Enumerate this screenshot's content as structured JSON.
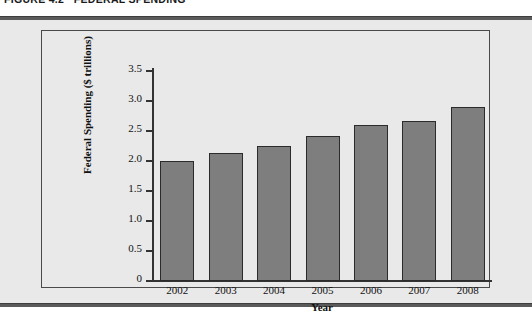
{
  "figure": {
    "caption": "FIGURE 4.2   FEDERAL SPENDING"
  },
  "chart_data": {
    "type": "bar",
    "title": "",
    "categories": [
      "2002",
      "2003",
      "2004",
      "2005",
      "2006",
      "2007",
      "2008"
    ],
    "values": [
      2.0,
      2.13,
      2.25,
      2.42,
      2.6,
      2.67,
      2.9
    ],
    "xlabel": "Year",
    "ylabel": "Federal Spending ($ trillions)",
    "ylim": [
      0,
      3.5
    ],
    "ytick_labels": [
      "0",
      "0.5",
      "1.0",
      "1.5",
      "2.0",
      "2.5",
      "3.0",
      "3.5"
    ],
    "ytick_values": [
      0,
      0.5,
      1.0,
      1.5,
      2.0,
      2.5,
      3.0,
      3.5
    ],
    "grid": false,
    "legend": null,
    "bar_color": "#7e7e7e",
    "bar_edge_color": "#2b2b2b",
    "panel_color": "#e9e9e9"
  }
}
